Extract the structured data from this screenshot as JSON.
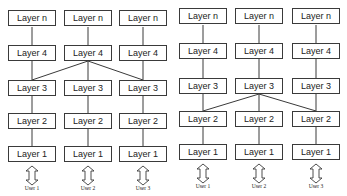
{
  "diagrams": [
    {
      "name": "left-architecture",
      "shared_link": "Layer 4 (center) connects to Layer 3 of all three stacks",
      "columns": [
        {
          "user": "User 1",
          "layers": [
            "Layer n",
            "Layer 4",
            "Layer 3",
            "Layer 2",
            "Layer 1"
          ]
        },
        {
          "user": "User 2",
          "layers": [
            "Layer n",
            "Layer 4",
            "Layer 3",
            "Layer 2",
            "Layer 1"
          ]
        },
        {
          "user": "User 3",
          "layers": [
            "Layer n",
            "Layer 4",
            "Layer 3",
            "Layer 2",
            "Layer 1"
          ]
        }
      ]
    },
    {
      "name": "right-architecture",
      "shared_link": "Layer 3 (center) connects to Layer 2 of all three stacks",
      "columns": [
        {
          "user": "User 1",
          "layers": [
            "Layer n",
            "Layer 4",
            "Layer 3",
            "Layer 2",
            "Layer 1"
          ]
        },
        {
          "user": "User 2",
          "layers": [
            "Layer n",
            "Layer 4",
            "Layer 3",
            "Layer 2",
            "Layer 1"
          ]
        },
        {
          "user": "User 3",
          "layers": [
            "Layer n",
            "Layer 4",
            "Layer 3",
            "Layer 2",
            "Layer 1"
          ]
        }
      ]
    }
  ],
  "colors": {
    "line": "#3a3a3a",
    "box_border": "#3a3a3a",
    "background": "#ffffff"
  }
}
